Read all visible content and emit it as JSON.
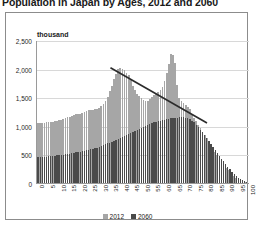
{
  "chart_data": {
    "type": "bar",
    "title": "Population in Japan by Ages, 2012 and 2060",
    "xlabel": "",
    "ylabel": "thousand",
    "unit_label": "thousand",
    "ylim": [
      0,
      2500
    ],
    "ytick_labels": [
      "2,500",
      "2,000",
      "1,500",
      "1,000",
      "500",
      "0"
    ],
    "ytick_values": [
      2500,
      2000,
      1500,
      1000,
      500,
      0
    ],
    "grid": true,
    "legend_position": "bottom",
    "xlim": [
      0,
      101
    ],
    "xtick_labels": [
      "0",
      "5",
      "10",
      "15",
      "20",
      "25",
      "30",
      "35",
      "40",
      "45",
      "50",
      "55",
      "60",
      "65",
      "70",
      "75",
      "80",
      "85",
      "90",
      "95",
      "100"
    ],
    "xtick_values": [
      0,
      5,
      10,
      15,
      20,
      25,
      30,
      35,
      40,
      45,
      50,
      55,
      60,
      65,
      70,
      75,
      80,
      85,
      90,
      95,
      100
    ],
    "x": [
      0,
      1,
      2,
      3,
      4,
      5,
      6,
      7,
      8,
      9,
      10,
      11,
      12,
      13,
      14,
      15,
      16,
      17,
      18,
      19,
      20,
      21,
      22,
      23,
      24,
      25,
      26,
      27,
      28,
      29,
      30,
      31,
      32,
      33,
      34,
      35,
      36,
      37,
      38,
      39,
      40,
      41,
      42,
      43,
      44,
      45,
      46,
      47,
      48,
      49,
      50,
      51,
      52,
      53,
      54,
      55,
      56,
      57,
      58,
      59,
      60,
      61,
      62,
      63,
      64,
      65,
      66,
      67,
      68,
      69,
      70,
      71,
      72,
      73,
      74,
      75,
      76,
      77,
      78,
      79,
      80,
      81,
      82,
      83,
      84,
      85,
      86,
      87,
      88,
      89,
      90,
      91,
      92,
      93,
      94,
      95,
      96,
      97,
      98,
      99,
      100
    ],
    "series": [
      {
        "name": "2012",
        "color": "#a6a6a6",
        "values": [
          1055,
          1050,
          1048,
          1055,
          1060,
          1065,
          1070,
          1075,
          1080,
          1090,
          1100,
          1110,
          1120,
          1135,
          1150,
          1160,
          1175,
          1190,
          1200,
          1205,
          1215,
          1230,
          1250,
          1265,
          1275,
          1280,
          1285,
          1290,
          1300,
          1320,
          1350,
          1390,
          1440,
          1510,
          1600,
          1700,
          1810,
          1910,
          1990,
          2010,
          2000,
          1975,
          1930,
          1880,
          1800,
          1700,
          1620,
          1560,
          1520,
          1480,
          1450,
          1430,
          1440,
          1465,
          1500,
          1530,
          1560,
          1590,
          1620,
          1680,
          1790,
          1930,
          2080,
          2250,
          2230,
          2100,
          1720,
          1490,
          1430,
          1400,
          1370,
          1330,
          1290,
          1210,
          1130,
          1080,
          1020,
          960,
          900,
          840,
          780,
          720,
          660,
          600,
          545,
          490,
          430,
          375,
          320,
          270,
          225,
          180,
          145,
          115,
          88,
          64,
          46,
          32,
          21,
          13,
          8
        ]
      },
      {
        "name": "2060",
        "color": "#4a4a4a",
        "values": [
          450,
          452,
          455,
          458,
          460,
          465,
          470,
          474,
          478,
          482,
          486,
          492,
          498,
          504,
          510,
          516,
          522,
          528,
          534,
          540,
          548,
          556,
          564,
          572,
          580,
          590,
          600,
          610,
          620,
          632,
          645,
          660,
          676,
          692,
          708,
          724,
          740,
          756,
          772,
          788,
          805,
          822,
          840,
          858,
          876,
          894,
          912,
          930,
          948,
          966,
          985,
          1000,
          1015,
          1030,
          1045,
          1058,
          1070,
          1082,
          1092,
          1100,
          1108,
          1115,
          1122,
          1128,
          1134,
          1140,
          1145,
          1148,
          1150,
          1148,
          1142,
          1130,
          1112,
          1088,
          1058,
          1022,
          980,
          935,
          888,
          840,
          790,
          738,
          686,
          634,
          582,
          530,
          478,
          428,
          378,
          330,
          284,
          240,
          198,
          160,
          126,
          96,
          70,
          48,
          31,
          18,
          9
        ]
      }
    ],
    "trendline": {
      "name": "trend",
      "color": "#2b2b2b",
      "x_start": 35,
      "y_start": 2030,
      "x_end": 81,
      "y_end": 1060
    }
  },
  "legend": {
    "items": [
      {
        "label": "2012",
        "color": "#a6a6a6"
      },
      {
        "label": "2060",
        "color": "#4a4a4a"
      }
    ]
  }
}
